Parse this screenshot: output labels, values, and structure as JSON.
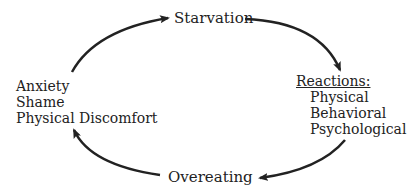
{
  "diagram": {
    "type": "cycle",
    "nodes": {
      "top": {
        "label": "Starvation"
      },
      "right": {
        "title": "Reactions:",
        "items": [
          "Physical",
          "Behavioral",
          "Psychological"
        ]
      },
      "bottom": {
        "label": "Overeating"
      },
      "left": {
        "items": [
          "Anxiety",
          "Shame",
          "Physical Discomfort"
        ]
      }
    },
    "edges": [
      {
        "from": "Starvation",
        "to": "Reactions"
      },
      {
        "from": "Reactions",
        "to": "Overeating"
      },
      {
        "from": "Overeating",
        "to": "Anxiety/Shame/Physical Discomfort"
      },
      {
        "from": "Anxiety/Shame/Physical Discomfort",
        "to": "Starvation"
      }
    ],
    "stroke_color": "#222222"
  }
}
